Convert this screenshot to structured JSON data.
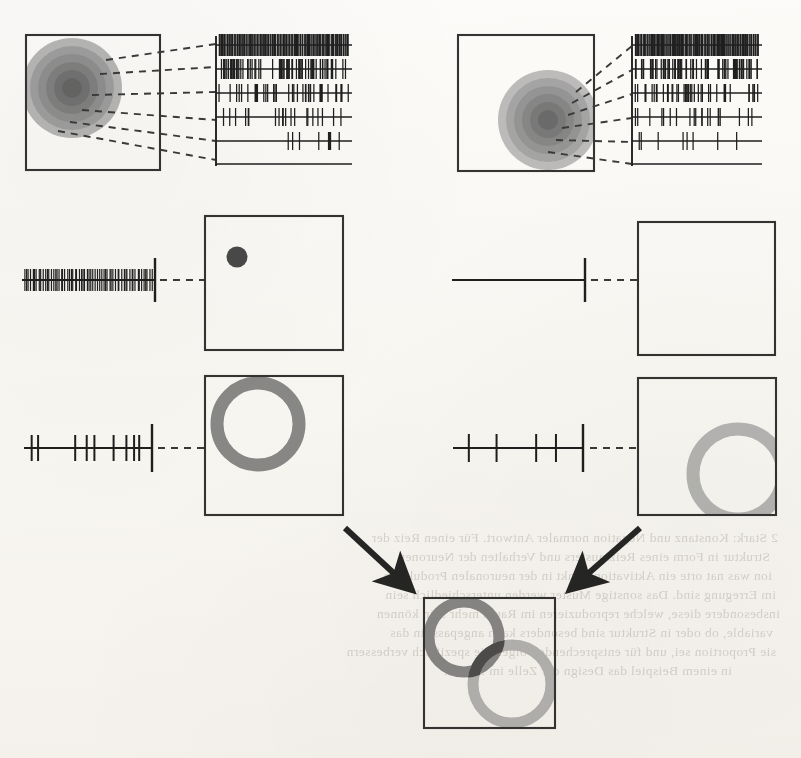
{
  "figure": {
    "background_color": "#fcfbf9",
    "ink_color": "#2b2b2b"
  },
  "palette": {
    "ink": "#2b2b2b",
    "box_stroke": "#343434",
    "dashed_line": "#3a3a3a",
    "spike": "#1f1f1f",
    "dot_fill": "#4a4a4a",
    "ring_dark": "#8a8a8a",
    "ring_light": "#b7b7b7",
    "ring_overlap": "#4f4f4f",
    "blob_1": "#a9a9a9",
    "blob_2": "#9a9a9a",
    "blob_3": "#8c8c8c",
    "blob_4": "#7e7e7e",
    "blob_5": "#707070",
    "blob_6": "#636363",
    "arrow": "#262626",
    "showthrough": "#b9b4ae"
  },
  "panels": [
    {
      "id": "panel-top-left",
      "row": 1,
      "column": "left",
      "label": "receptive-field-gradient-left",
      "box": {
        "x": 26,
        "y": 35,
        "width": 134,
        "height": 135
      },
      "blob": {
        "center_x": 72,
        "center_y": 88,
        "shape": "concentric-rings",
        "ring_count": 6,
        "radii": [
          50,
          42,
          34,
          26,
          18,
          10
        ],
        "position_note": "upper-left, clipped by box edge"
      },
      "raster": {
        "x": 216,
        "y": 36,
        "width": 136,
        "height": 128,
        "axis_line": true,
        "rows": 6,
        "row_densities": [
          0.98,
          0.62,
          0.34,
          0.17,
          0.07,
          0.0
        ],
        "row_labels": [
          "very-high",
          "high",
          "medium",
          "low",
          "very-low",
          "none"
        ]
      },
      "connectors": 6
    },
    {
      "id": "panel-top-right",
      "row": 1,
      "column": "right",
      "label": "receptive-field-gradient-right",
      "box": {
        "x": 458,
        "y": 35,
        "width": 136,
        "height": 136
      },
      "blob": {
        "center_x": 548,
        "center_y": 120,
        "shape": "concentric-rings",
        "ring_count": 6,
        "radii": [
          50,
          42,
          34,
          26,
          18,
          10
        ],
        "position_note": "lower-right of center, fully inside box"
      },
      "raster": {
        "x": 632,
        "y": 36,
        "width": 130,
        "height": 128,
        "axis_line": true,
        "rows": 6,
        "row_densities": [
          0.98,
          0.62,
          0.34,
          0.17,
          0.07,
          0.0
        ],
        "row_labels": [
          "very-high",
          "high",
          "medium",
          "low",
          "very-low",
          "none"
        ]
      },
      "connectors": 6
    },
    {
      "id": "panel-mid-left",
      "row": 2,
      "column": "left",
      "label": "dense-spike-train-to-point",
      "spike_train": {
        "x": 22,
        "y": 280,
        "length": 133,
        "density": "dense",
        "spike_count": 64,
        "terminal_tick": true
      },
      "dashed_gap": {
        "from_x": 158,
        "to_x": 205,
        "y": 280
      },
      "box": {
        "x": 205,
        "y": 216,
        "width": 138,
        "height": 134
      },
      "marker": {
        "type": "filled-dot",
        "center_x": 237,
        "center_y": 257,
        "radius": 10,
        "position_note": "upper-left quadrant"
      }
    },
    {
      "id": "panel-mid-right",
      "row": 2,
      "column": "right",
      "label": "silent-spike-train-to-empty-box",
      "spike_train": {
        "x": 452,
        "y": 280,
        "length": 132,
        "density": "none",
        "spike_count": 0,
        "terminal_tick": true
      },
      "dashed_gap": {
        "from_x": 588,
        "to_x": 638,
        "y": 280
      },
      "box": {
        "x": 638,
        "y": 222,
        "width": 137,
        "height": 133
      },
      "marker": {
        "type": "none"
      }
    },
    {
      "id": "panel-low-left",
      "row": 3,
      "column": "left",
      "label": "sparse-spike-train-to-ring-dark",
      "spike_train": {
        "x": 24,
        "y": 448,
        "length": 128,
        "density": "sparse",
        "spike_count": 9,
        "spike_positions": [
          0.06,
          0.11,
          0.4,
          0.49,
          0.55,
          0.7,
          0.8,
          0.86,
          0.9
        ],
        "terminal_tick": true
      },
      "dashed_gap": {
        "from_x": 158,
        "to_x": 205,
        "y": 448
      },
      "box": {
        "x": 205,
        "y": 376,
        "width": 138,
        "height": 139
      },
      "marker": {
        "type": "ring",
        "center_x": 258,
        "center_y": 424,
        "radius": 41,
        "stroke_width": 13,
        "color_key": "ring_dark",
        "position_note": "upper-left, clipped at top edge"
      }
    },
    {
      "id": "panel-low-right",
      "row": 3,
      "column": "right",
      "label": "sparse-spike-train-to-ring-light",
      "spike_train": {
        "x": 453,
        "y": 448,
        "length": 132,
        "density": "very-sparse",
        "spike_count": 4,
        "spike_positions": [
          0.12,
          0.33,
          0.63,
          0.78
        ],
        "terminal_tick": true
      },
      "dashed_gap": {
        "from_x": 590,
        "to_x": 638,
        "y": 448
      },
      "box": {
        "x": 638,
        "y": 378,
        "width": 138,
        "height": 137
      },
      "marker": {
        "type": "ring",
        "center_x": 738,
        "center_y": 474,
        "radius": 45,
        "stroke_width": 13,
        "color_key": "ring_light",
        "position_note": "lower-right, clipped at right edge"
      }
    },
    {
      "id": "panel-summary",
      "row": 4,
      "column": "center",
      "label": "overlapping-rings-summary",
      "box": {
        "x": 424,
        "y": 598,
        "width": 131,
        "height": 130
      },
      "rings": [
        {
          "name": "ring-dark-upper-left",
          "center_x": 464,
          "center_y": 637,
          "radius": 35,
          "stroke_width": 11,
          "color_key": "ring_dark"
        },
        {
          "name": "ring-light-lower-right",
          "center_x": 512,
          "center_y": 684,
          "radius": 39,
          "stroke_width": 11,
          "color_key": "ring_light"
        }
      ],
      "overlap": {
        "present": true,
        "color_key": "ring_overlap",
        "note": "dark wedge where the two rings intersect"
      }
    }
  ],
  "arrows": [
    {
      "name": "arrow-from-left",
      "from_x": 345,
      "from_y": 528,
      "to_x": 404,
      "to_y": 583,
      "direction": "down-right"
    },
    {
      "name": "arrow-from-right",
      "from_x": 640,
      "from_y": 528,
      "to_x": 578,
      "to_y": 583,
      "direction": "down-left"
    }
  ],
  "showthrough_text": {
    "note": "Mirrored ink bleeding through from the reverse page; not part of the figure.",
    "lines": [
      "2 Stark: Konstanz und Negation normaler Antwort. Für einen Reiz der",
      "Struktur in Form eines Reizmusters und Verhalten der Neuronen",
      "ion was nat orte ein Aktivation Punkt in der neuronalen Produktion",
      "im Erregung sind. Das sonstige Muster werden unterschiedlich sein",
      "insbesondere diese, welche reproduzieren im Raum mehr sein können",
      "variable, ob oder in Struktur sind besonders kann angepasst in das",
      "sie Proportion sei, und für entsprechende Folge. Die spezifisch verbessern",
      "in einem Beispiel das Design der Zelle im Schnitt"
    ]
  }
}
